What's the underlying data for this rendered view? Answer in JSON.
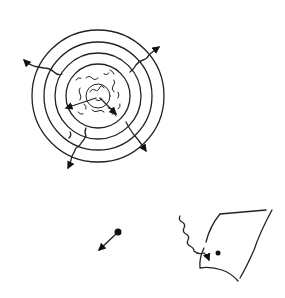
{
  "diagram": {
    "stroke_color": "#222222",
    "background": "#ffffff",
    "star": {
      "center": [
        98,
        96
      ],
      "shell_radii": [
        66,
        54,
        43,
        32
      ],
      "core_radius": 12,
      "escaping_photons": 5
    },
    "particle": {
      "position": [
        118,
        232
      ],
      "arrow_direction": "down-left"
    },
    "surface": {
      "shape": "curved sheet",
      "photon": "wavy incoming",
      "hit_point": [
        218,
        253
      ]
    }
  }
}
